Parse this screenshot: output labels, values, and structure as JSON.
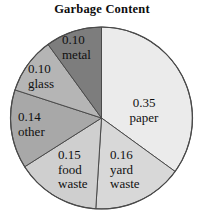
{
  "chart_data": {
    "type": "pie",
    "title": "Garbage Content",
    "xlabel": "",
    "ylabel": "",
    "legend": "none",
    "grid": false,
    "start_angle_deg": 90,
    "direction": "clockwise",
    "categories": [
      "paper",
      "yard waste",
      "food waste",
      "other",
      "glass",
      "metal"
    ],
    "values": [
      0.35,
      0.16,
      0.15,
      0.14,
      0.1,
      0.1
    ],
    "slices": [
      {
        "name": "paper",
        "value": "0.35",
        "value_num": 0.35,
        "color": "#ebebeb"
      },
      {
        "name": "yard waste",
        "value": "0.16",
        "value_num": 0.16,
        "color": "#d8d8d8"
      },
      {
        "name": "food waste",
        "value": "0.15",
        "value_num": 0.15,
        "color": "#cfcfcf"
      },
      {
        "name": "other",
        "value": "0.14",
        "value_num": 0.14,
        "color": "#a8a8a8"
      },
      {
        "name": "glass",
        "value": "0.10",
        "value_num": 0.1,
        "color": "#b5b5b5"
      },
      {
        "name": "metal",
        "value": "0.10",
        "value_num": 0.1,
        "color": "#7d7d7d"
      }
    ]
  },
  "labels": {
    "paper": {
      "value": "0.35",
      "name": "paper"
    },
    "yard_waste": {
      "value": "0.16",
      "name_line1": "yard",
      "name_line2": "waste"
    },
    "food_waste": {
      "value": "0.15",
      "name_line1": "food",
      "name_line2": "waste"
    },
    "other": {
      "value": "0.14",
      "name": "other"
    },
    "glass": {
      "value": "0.10",
      "name": "glass"
    },
    "metal": {
      "value": "0.10",
      "name": "metal"
    }
  },
  "style": {
    "outline_color": "#4a4a4a",
    "text_color": "#101010",
    "background": "#ffffff"
  }
}
